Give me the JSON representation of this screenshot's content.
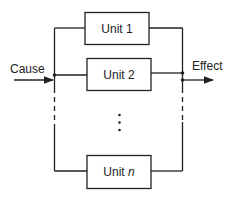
{
  "diagram": {
    "type": "parallel-system-block-diagram",
    "input_label": "Cause",
    "output_label": "Effect",
    "units": [
      {
        "prefix": "Unit",
        "index": "1"
      },
      {
        "prefix": "Unit",
        "index": "2"
      },
      {
        "prefix": "Unit",
        "index": "n"
      }
    ],
    "ellipsis": "⋮",
    "colors": {
      "line": "#222222",
      "background": "#ffffff"
    }
  }
}
